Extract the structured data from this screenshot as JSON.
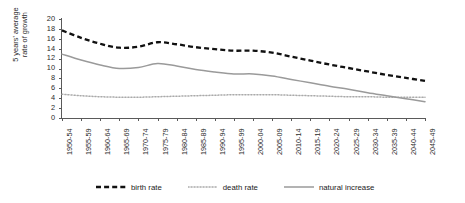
{
  "chart_data": {
    "type": "line",
    "title": "",
    "xlabel": "",
    "ylabel": "5 years' average\nrate of growth",
    "ylim": [
      0,
      20
    ],
    "ytick_step": 2,
    "yticks": [
      0,
      2,
      4,
      6,
      8,
      10,
      12,
      14,
      16,
      18,
      20
    ],
    "grid": false,
    "legend_position": "bottom",
    "categories": [
      "1950-54",
      "1955-59",
      "1960-64",
      "1965-69",
      "1970-74",
      "1975-79",
      "1980-84",
      "1985-89",
      "1990-94",
      "1995-99",
      "2000-04",
      "2005-09",
      "2010-14",
      "2015-19",
      "2020-24",
      "2025-29",
      "2030-34",
      "2035-39",
      "2040-44",
      "2045-49"
    ],
    "series": [
      {
        "name": "birth rate",
        "style": "dashed",
        "color": "#111111",
        "values": [
          17.7,
          16.2,
          15.0,
          14.2,
          14.4,
          15.3,
          14.9,
          14.3,
          13.9,
          13.6,
          13.6,
          13.2,
          12.4,
          11.6,
          10.8,
          10.1,
          9.4,
          8.7,
          8.1,
          7.5
        ]
      },
      {
        "name": "death rate",
        "style": "dotted",
        "color": "#aaaaaa",
        "values": [
          4.8,
          4.5,
          4.3,
          4.2,
          4.2,
          4.3,
          4.4,
          4.5,
          4.6,
          4.7,
          4.7,
          4.7,
          4.6,
          4.5,
          4.4,
          4.3,
          4.3,
          4.2,
          4.2,
          4.2
        ]
      },
      {
        "name": "natural increase",
        "style": "solid",
        "color": "#9a9a9a",
        "values": [
          12.9,
          11.7,
          10.7,
          10.0,
          10.2,
          11.0,
          10.5,
          9.8,
          9.3,
          8.9,
          8.9,
          8.5,
          7.8,
          7.1,
          6.4,
          5.8,
          5.1,
          4.5,
          3.9,
          3.3
        ]
      }
    ],
    "legend": [
      {
        "label": "birth rate",
        "style": "dashed",
        "color": "#111111"
      },
      {
        "label": "death rate",
        "style": "dotted",
        "color": "#aaaaaa"
      },
      {
        "label": "natural increase",
        "style": "solid",
        "color": "#9a9a9a"
      }
    ]
  }
}
